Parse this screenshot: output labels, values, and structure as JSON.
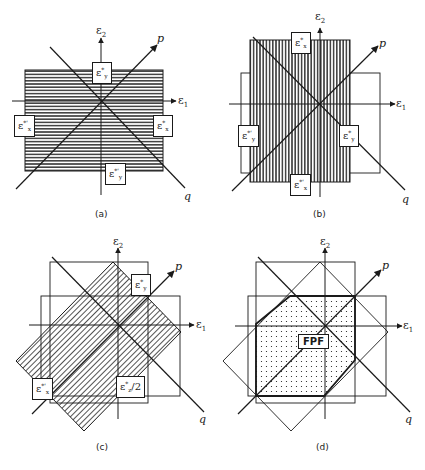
{
  "figure": {
    "colors": {
      "ink": "#1a1a1a",
      "background": "#ffffff"
    },
    "axes": {
      "e1": "ε",
      "e1_sub": "1",
      "e2": "ε",
      "e2_sub": "2",
      "p": "p",
      "q": "q"
    },
    "panels": [
      {
        "id": "a",
        "caption": "(a)",
        "hatch": "horizontal",
        "labels": [
          {
            "base": "ε",
            "sup": "*",
            "sub": "y"
          },
          {
            "base": "ε",
            "sup": "*'",
            "sub": "x"
          },
          {
            "base": "ε",
            "sup": "*",
            "sub": "x"
          },
          {
            "base": "ε",
            "sup": "*'",
            "sub": "y"
          }
        ]
      },
      {
        "id": "b",
        "caption": "(b)",
        "hatch": "vertical",
        "labels": [
          {
            "base": "ε",
            "sup": "*",
            "sub": "x"
          },
          {
            "base": "ε",
            "sup": "*'",
            "sub": "y"
          },
          {
            "base": "ε",
            "sup": "*",
            "sub": "y"
          },
          {
            "base": "ε",
            "sup": "*'",
            "sub": "x"
          }
        ]
      },
      {
        "id": "c",
        "caption": "(c)",
        "hatch": "diagonal",
        "labels": [
          {
            "base": "ε",
            "sup": "*",
            "sub": "y"
          },
          {
            "base": "ε",
            "sup": "*'",
            "sub": "x"
          },
          {
            "base": "ε",
            "sup": "*",
            "sub": "z",
            "suffix": "/2"
          }
        ]
      },
      {
        "id": "d",
        "caption": "(d)",
        "hatch": "dots",
        "labels": [
          {
            "text": "FPF"
          }
        ]
      }
    ]
  }
}
